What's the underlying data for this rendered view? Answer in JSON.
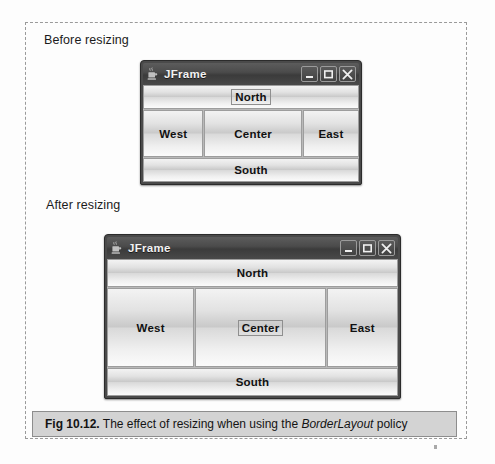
{
  "figure": {
    "caption_number": "Fig 10.12.",
    "caption_before_em": " The effect of resizing when using the ",
    "caption_em": "BorderLayout",
    "caption_after_em": " policy"
  },
  "sections": {
    "before_label": "Before resizing",
    "after_label": "After resizing"
  },
  "window_before": {
    "title": "JFrame",
    "icon": "java-cup-icon",
    "buttons": {
      "minimize": "minimize-icon",
      "maximize": "maximize-icon",
      "close": "close-icon"
    },
    "regions": {
      "north": "North",
      "west": "West",
      "center": "Center",
      "east": "East",
      "south": "South"
    },
    "focused_region": "North"
  },
  "window_after": {
    "title": "JFrame",
    "icon": "java-cup-icon",
    "buttons": {
      "minimize": "minimize-icon",
      "maximize": "maximize-icon",
      "close": "close-icon"
    },
    "regions": {
      "north": "North",
      "west": "West",
      "center": "Center",
      "east": "East",
      "south": "South"
    },
    "focused_region": "Center"
  },
  "colors": {
    "titlebar_dark": "#3b3b3b",
    "button_face": "#d9d9d9",
    "caption_bar": "#d3d3d3",
    "dashed_border": "#9a9a9a"
  }
}
